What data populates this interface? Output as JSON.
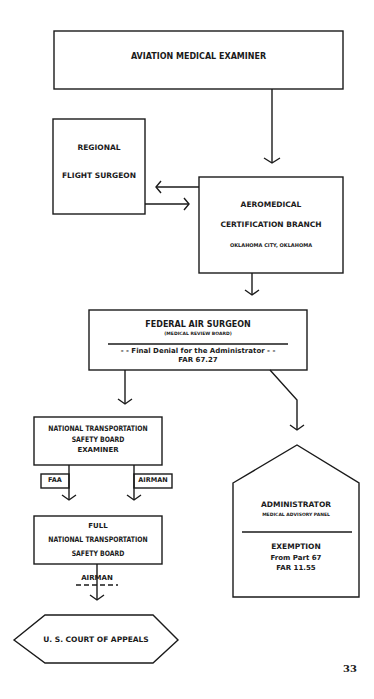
{
  "diagram": {
    "nodes": {
      "ame": {
        "label": "AVIATION MEDICAL EXAMINER"
      },
      "rfs": {
        "line1": "REGIONAL",
        "line2": "FLIGHT SURGEON"
      },
      "acb": {
        "line1": "AEROMEDICAL",
        "line2": "CERTIFICATION BRANCH",
        "line3": "OKLAHOMA CITY, OKLAHOMA"
      },
      "fas": {
        "line1": "FEDERAL AIR SURGEON",
        "line2": "(MEDICAL REVIEW BOARD)",
        "line3": "- - Final Denial for the Administrator - -",
        "line4": "FAR 67.27"
      },
      "ntsbe": {
        "line1": "NATIONAL TRANSPORTATION",
        "line2": "SAFETY BOARD",
        "line3": "EXAMINER"
      },
      "ntsbf": {
        "line1": "FULL",
        "line2": "NATIONAL TRANSPORTATION",
        "line3": "SAFETY BOARD"
      },
      "court": {
        "label": "U. S. COURT OF APPEALS"
      },
      "admin": {
        "line1": "ADMINISTRATOR",
        "line2": "MEDICAL ADVISORY PANEL",
        "line3": "EXEMPTION",
        "line4": "From Part 67",
        "line5": "FAR 11.55"
      }
    },
    "labels": {
      "faa": "FAA",
      "airman1": "AIRMAN",
      "airman2": "AIRMAN"
    },
    "page_number": "33"
  }
}
